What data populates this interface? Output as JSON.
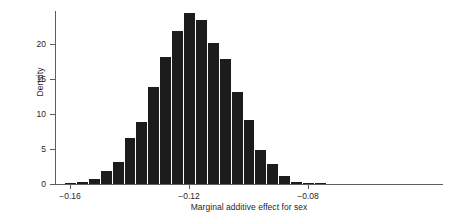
{
  "chart_data": {
    "type": "bar",
    "title": "",
    "subtitle": "",
    "xlabel": "Marginal additive effect for sex",
    "ylabel": "Density",
    "grid": false,
    "legend": false,
    "legend_position": "none",
    "bar_color": "#1c1c1c",
    "axis_color": "#5d5d5d",
    "xlim": [
      -0.175,
      -0.055
    ],
    "ylim": [
      0,
      25
    ],
    "xticks": [
      -0.16,
      -0.12,
      -0.08
    ],
    "xtick_labels": [
      "-0.16",
      "-0.12",
      "-0.08"
    ],
    "yticks": [
      0,
      5,
      10,
      15,
      20
    ],
    "ytick_labels": [
      "0",
      "5",
      "10",
      "15",
      "20"
    ],
    "bin_width": 0.004,
    "bin_starts": [
      -0.162,
      -0.158,
      -0.154,
      -0.15,
      -0.146,
      -0.142,
      -0.138,
      -0.134,
      -0.13,
      -0.126,
      -0.122,
      -0.118,
      -0.114,
      -0.11,
      -0.106,
      -0.102,
      -0.098,
      -0.094,
      -0.09,
      -0.086,
      -0.082,
      -0.078
    ],
    "categories": [
      "-0.162",
      "-0.158",
      "-0.154",
      "-0.150",
      "-0.146",
      "-0.142",
      "-0.138",
      "-0.134",
      "-0.130",
      "-0.126",
      "-0.122",
      "-0.118",
      "-0.114",
      "-0.110",
      "-0.106",
      "-0.102",
      "-0.098",
      "-0.094",
      "-0.090",
      "-0.086",
      "-0.082",
      "-0.078"
    ],
    "values": [
      0.1,
      0.35,
      0.75,
      1.85,
      3.1,
      6.6,
      8.8,
      13.9,
      18.1,
      21.9,
      24.4,
      23.5,
      20.1,
      17.8,
      13.2,
      9.2,
      4.9,
      2.8,
      1.2,
      0.3,
      0.1,
      0.05
    ]
  }
}
